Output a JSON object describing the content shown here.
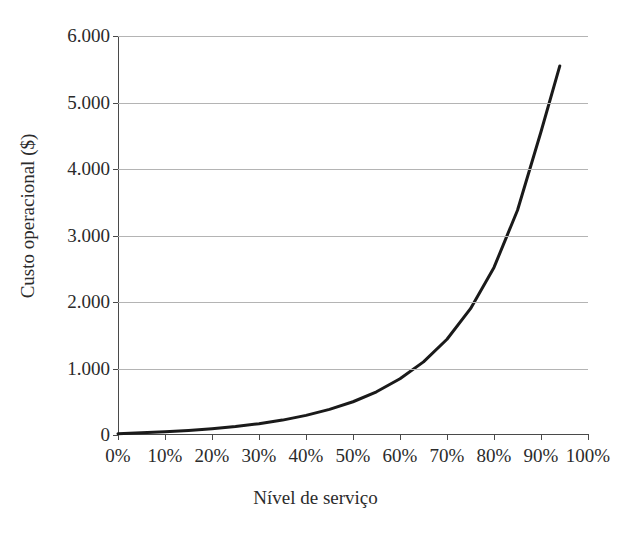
{
  "chart_data": {
    "type": "line",
    "title": "",
    "xlabel": "Nível de serviço",
    "ylabel": "Custo operacional ($)",
    "xlim": [
      0,
      100
    ],
    "ylim": [
      0,
      6000
    ],
    "xtick_labels": [
      "0%",
      "10%",
      "20%",
      "30%",
      "40%",
      "50%",
      "60%",
      "70%",
      "80%",
      "90%",
      "100%"
    ],
    "xticks": [
      0,
      10,
      20,
      30,
      40,
      50,
      60,
      70,
      80,
      90,
      100
    ],
    "ytick_labels": [
      "0",
      "1.000",
      "2.000",
      "3.000",
      "4.000",
      "5.000",
      "6.000"
    ],
    "yticks": [
      0,
      1000,
      2000,
      3000,
      4000,
      5000,
      6000
    ],
    "grid": "horizontal",
    "legend": "none",
    "series": [
      {
        "name": "Custo operacional",
        "color": "#1a1a1a",
        "line_width": 3,
        "x": [
          0,
          5,
          10,
          15,
          20,
          25,
          30,
          35,
          40,
          45,
          50,
          55,
          60,
          65,
          70,
          75,
          80,
          85,
          90,
          94
        ],
        "y": [
          20,
          32,
          48,
          68,
          95,
          128,
          170,
          224,
          295,
          385,
          500,
          650,
          845,
          1100,
          1440,
          1900,
          2520,
          3380,
          4560,
          5550
        ]
      }
    ],
    "annotations": []
  },
  "axis_titles": {
    "y": "Custo operacional ($)",
    "x": "Nível de serviço"
  },
  "top_title": ""
}
